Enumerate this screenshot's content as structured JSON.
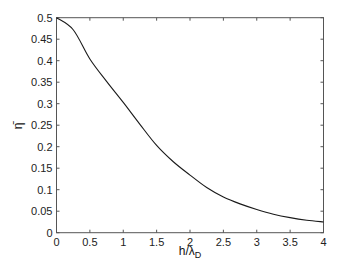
{
  "chart_data": {
    "type": "line",
    "title": "",
    "xlabel": "h/λ_D",
    "xlabel_main": "h/λ",
    "xlabel_sub": "D",
    "ylabel": "η̄",
    "xlim": [
      0,
      4
    ],
    "ylim": [
      0,
      0.5
    ],
    "grid": false,
    "legend": null,
    "x_ticks": [
      0,
      0.5,
      1,
      1.5,
      2,
      2.5,
      3,
      3.5,
      4
    ],
    "x_tick_labels": [
      "0",
      "0.5",
      "1",
      "1.5",
      "2",
      "2.5",
      "3",
      "3.5",
      "4"
    ],
    "y_ticks": [
      0,
      0.05,
      0.1,
      0.15,
      0.2,
      0.25,
      0.3,
      0.35,
      0.4,
      0.45,
      0.5
    ],
    "y_tick_labels": [
      "0",
      "0.05",
      "0.1",
      "0.15",
      "0.2",
      "0.25",
      "0.3",
      "0.35",
      "0.4",
      "0.45",
      "0.5"
    ],
    "series": [
      {
        "name": "η̄",
        "color": "#1a1a1a",
        "x": [
          0,
          0.25,
          0.5,
          0.75,
          1,
          1.25,
          1.5,
          1.75,
          2,
          2.25,
          2.5,
          2.75,
          3,
          3.25,
          3.5,
          3.75,
          4
        ],
        "values": [
          0.5,
          0.472,
          0.404,
          0.352,
          0.303,
          0.252,
          0.203,
          0.165,
          0.134,
          0.105,
          0.083,
          0.067,
          0.054,
          0.043,
          0.035,
          0.029,
          0.025
        ]
      }
    ]
  }
}
